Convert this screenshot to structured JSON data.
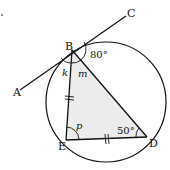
{
  "diagram": {
    "type": "circle-geometry",
    "points": {
      "A": {
        "label": "A"
      },
      "B": {
        "label": "B"
      },
      "C": {
        "label": "C"
      },
      "D": {
        "label": "D"
      },
      "E": {
        "label": "E"
      }
    },
    "angles": {
      "k": "k",
      "m": "m",
      "p": "p",
      "angle_CBD": "80°",
      "angle_EDB": "50°"
    },
    "tangent_line": "A-B-C tangent to circle at B",
    "triangle": "BED (shaded)",
    "equal_sides": [
      "BE",
      "ED"
    ],
    "colors": {
      "stroke": "#111111",
      "fill": "#ececec"
    }
  }
}
